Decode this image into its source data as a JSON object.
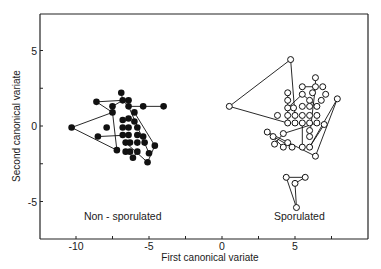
{
  "chart_data": {
    "type": "scatter",
    "title": "",
    "xlabel": "First canonical  variate",
    "ylabel": "Second canonical variate",
    "xlim": [
      -12.5,
      10
    ],
    "ylim": [
      -7.5,
      7.4
    ],
    "grid": false,
    "legend": "none (groups labelled by in-plot annotations)",
    "x_ticks": [
      {
        "value": -10,
        "label": "-10"
      },
      {
        "value": -7.5,
        "label": ""
      },
      {
        "value": -5,
        "label": "-5"
      },
      {
        "value": -2.5,
        "label": ""
      },
      {
        "value": 0,
        "label": "0"
      },
      {
        "value": 2.5,
        "label": ""
      },
      {
        "value": 5,
        "label": "5"
      },
      {
        "value": 7.5,
        "label": ""
      }
    ],
    "y_ticks": [
      {
        "value": 5,
        "label": "5"
      },
      {
        "value": 2.5,
        "label": ""
      },
      {
        "value": 0,
        "label": "0"
      },
      {
        "value": -2.5,
        "label": ""
      },
      {
        "value": -5,
        "label": "-5"
      }
    ],
    "annotations": [
      {
        "text": "Non - sporulated",
        "x": -6.8,
        "y": -6.2
      },
      {
        "text": "Sporulated",
        "x": 5.3,
        "y": -6.2
      }
    ],
    "series": [
      {
        "name": "Non-sporulated",
        "marker": "filled-circle",
        "color": "#111111",
        "points": [
          [
            -10.3,
            -0.1
          ],
          [
            -8.6,
            1.6
          ],
          [
            -8.5,
            -0.7
          ],
          [
            -7.9,
            -0.1
          ],
          [
            -7.5,
            1.3
          ],
          [
            -7.5,
            0.9
          ],
          [
            -7.2,
            -1.6
          ],
          [
            -6.9,
            2.2
          ],
          [
            -6.8,
            1.7
          ],
          [
            -6.8,
            0.4
          ],
          [
            -6.8,
            -0.1
          ],
          [
            -6.8,
            -0.6
          ],
          [
            -6.6,
            -1.1
          ],
          [
            -6.6,
            -1.7
          ],
          [
            -6.4,
            1.7
          ],
          [
            -6.4,
            1.3
          ],
          [
            -6.4,
            0.5
          ],
          [
            -6.4,
            -0.1
          ],
          [
            -6.4,
            -0.6
          ],
          [
            -6.3,
            -1.1
          ],
          [
            -6.3,
            -1.7
          ],
          [
            -6.1,
            -2.1
          ],
          [
            -6.0,
            0.9
          ],
          [
            -6.0,
            0.3
          ],
          [
            -5.8,
            -0.1
          ],
          [
            -5.8,
            -0.6
          ],
          [
            -5.8,
            -1.1
          ],
          [
            -5.8,
            -1.7
          ],
          [
            -5.4,
            1.3
          ],
          [
            -5.4,
            -0.7
          ],
          [
            -5.3,
            -1.1
          ],
          [
            -5.1,
            -2.4
          ],
          [
            -5.0,
            -1.8
          ],
          [
            -4.6,
            -1.3
          ],
          [
            -4.0,
            1.3
          ]
        ],
        "connecting_lines": [
          [
            [
              -10.3,
              -0.1
            ],
            [
              -7.5,
              0.9
            ]
          ],
          [
            [
              -10.3,
              -0.1
            ],
            [
              -7.2,
              -1.6
            ]
          ],
          [
            [
              -8.6,
              1.6
            ],
            [
              -7.5,
              0.9
            ]
          ],
          [
            [
              -8.6,
              1.6
            ],
            [
              -6.8,
              1.7
            ]
          ],
          [
            [
              -8.5,
              -0.7
            ],
            [
              -6.4,
              -0.6
            ]
          ],
          [
            [
              -7.5,
              1.3
            ],
            [
              -6.8,
              1.7
            ]
          ],
          [
            [
              -7.5,
              0.9
            ],
            [
              -7.2,
              -1.6
            ]
          ],
          [
            [
              -6.9,
              2.2
            ],
            [
              -6.8,
              1.7
            ]
          ],
          [
            [
              -6.8,
              1.7
            ],
            [
              -6.4,
              1.3
            ]
          ],
          [
            [
              -6.4,
              1.3
            ],
            [
              -5.0,
              -1.8
            ]
          ],
          [
            [
              -6.0,
              0.9
            ],
            [
              -4.6,
              -1.3
            ]
          ],
          [
            [
              -4.6,
              -1.3
            ],
            [
              -5.1,
              -2.4
            ]
          ],
          [
            [
              -6.4,
              1.3
            ],
            [
              -4.0,
              1.3
            ]
          ],
          [
            [
              -6.6,
              -1.1
            ],
            [
              -5.1,
              -2.4
            ]
          ],
          [
            [
              -5.8,
              -1.7
            ],
            [
              -6.1,
              -2.1
            ]
          ]
        ]
      },
      {
        "name": "Sporulated",
        "marker": "open-circle",
        "color": "#111111",
        "points": [
          [
            0.5,
            1.3
          ],
          [
            4.7,
            4.4
          ],
          [
            4.5,
            2.2
          ],
          [
            4.5,
            1.7
          ],
          [
            4.5,
            1.2
          ],
          [
            3.8,
            0.7
          ],
          [
            4.5,
            0.7
          ],
          [
            4.5,
            0.2
          ],
          [
            4.9,
            1.2
          ],
          [
            5.0,
            0.7
          ],
          [
            5.0,
            0.2
          ],
          [
            5.5,
            2.6
          ],
          [
            5.5,
            2.1
          ],
          [
            5.5,
            1.3
          ],
          [
            5.5,
            0.7
          ],
          [
            5.5,
            0.2
          ],
          [
            6.0,
            1.7
          ],
          [
            6.0,
            1.3
          ],
          [
            6.0,
            0.7
          ],
          [
            6.0,
            0.2
          ],
          [
            6.0,
            -0.3
          ],
          [
            6.0,
            -0.7
          ],
          [
            6.4,
            3.2
          ],
          [
            6.4,
            2.6
          ],
          [
            6.5,
            1.3
          ],
          [
            6.5,
            0.7
          ],
          [
            6.5,
            0.2
          ],
          [
            6.8,
            1.7
          ],
          [
            6.9,
            2.6
          ],
          [
            7.0,
            0.1
          ],
          [
            7.1,
            2.1
          ],
          [
            7.9,
            1.8
          ],
          [
            6.2,
            2.2
          ],
          [
            3.1,
            -0.4
          ],
          [
            3.5,
            -0.7
          ],
          [
            3.6,
            -1.2
          ],
          [
            4.2,
            -0.5
          ],
          [
            4.2,
            -1.4
          ],
          [
            4.5,
            -1.1
          ],
          [
            4.8,
            -1.4
          ],
          [
            5.5,
            -1.4
          ],
          [
            6.0,
            -1.4
          ],
          [
            6.4,
            -2.0
          ],
          [
            4.4,
            -3.4
          ],
          [
            5.7,
            -3.4
          ],
          [
            5.0,
            -3.8
          ],
          [
            5.1,
            -5.4
          ]
        ],
        "connecting_lines": [
          [
            [
              0.5,
              1.3
            ],
            [
              4.7,
              4.4
            ]
          ],
          [
            [
              0.5,
              1.3
            ],
            [
              4.5,
              0.2
            ]
          ],
          [
            [
              4.7,
              4.4
            ],
            [
              5.0,
              0.7
            ]
          ],
          [
            [
              4.5,
              2.2
            ],
            [
              4.5,
              0.2
            ]
          ],
          [
            [
              4.5,
              1.2
            ],
            [
              5.5,
              2.1
            ]
          ],
          [
            [
              5.5,
              2.6
            ],
            [
              6.4,
              2.6
            ]
          ],
          [
            [
              6.4,
              3.2
            ],
            [
              6.4,
              2.6
            ]
          ],
          [
            [
              6.4,
              2.6
            ],
            [
              6.0,
              -0.7
            ]
          ],
          [
            [
              5.5,
              2.1
            ],
            [
              6.5,
              1.3
            ]
          ],
          [
            [
              7.9,
              1.8
            ],
            [
              6.0,
              -1.4
            ]
          ],
          [
            [
              7.9,
              1.8
            ],
            [
              6.4,
              -2.0
            ]
          ],
          [
            [
              3.1,
              -0.4
            ],
            [
              6.4,
              -2.0
            ]
          ],
          [
            [
              3.1,
              -0.4
            ],
            [
              4.2,
              -1.4
            ]
          ],
          [
            [
              3.5,
              -0.7
            ],
            [
              4.8,
              -1.4
            ]
          ],
          [
            [
              4.2,
              -0.5
            ],
            [
              6.5,
              0.2
            ]
          ],
          [
            [
              4.2,
              -0.5
            ],
            [
              3.6,
              -1.2
            ]
          ],
          [
            [
              5.5,
              0.2
            ],
            [
              5.5,
              -1.4
            ]
          ],
          [
            [
              6.0,
              -1.4
            ],
            [
              7.0,
              0.1
            ]
          ],
          [
            [
              4.4,
              -3.4
            ],
            [
              5.7,
              -3.4
            ]
          ],
          [
            [
              4.4,
              -3.4
            ],
            [
              5.1,
              -5.4
            ]
          ],
          [
            [
              5.7,
              -3.4
            ],
            [
              5.0,
              -3.8
            ]
          ],
          [
            [
              5.0,
              -3.8
            ],
            [
              5.1,
              -5.4
            ]
          ]
        ]
      }
    ]
  },
  "layout": {
    "plot_left": 40,
    "plot_top": 14,
    "plot_right": 368,
    "plot_bottom": 239,
    "x_zero_px": 222,
    "x_unit_px": 14.6,
    "y_zero_px": 126,
    "y_unit_px": 15.1
  }
}
